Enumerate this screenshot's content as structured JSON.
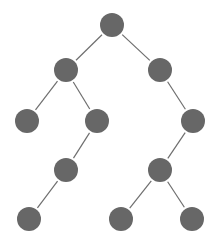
{
  "diagram": {
    "type": "binary-tree",
    "width": 219,
    "height": 244,
    "colors": {
      "node_fill": "#676767",
      "edge_stroke": "#6e6e6e",
      "background": "#ffffff"
    },
    "node_radius": 12,
    "nodes": [
      {
        "id": "n0",
        "x": 112,
        "y": 25,
        "level": 0
      },
      {
        "id": "n1",
        "x": 66,
        "y": 70,
        "level": 1
      },
      {
        "id": "n2",
        "x": 160,
        "y": 70,
        "level": 1
      },
      {
        "id": "n3",
        "x": 27,
        "y": 121,
        "level": 2
      },
      {
        "id": "n4",
        "x": 97,
        "y": 121,
        "level": 2
      },
      {
        "id": "n5",
        "x": 193,
        "y": 121,
        "level": 2
      },
      {
        "id": "n6",
        "x": 66,
        "y": 170,
        "level": 3
      },
      {
        "id": "n7",
        "x": 160,
        "y": 170,
        "level": 3
      },
      {
        "id": "n8",
        "x": 29,
        "y": 219,
        "level": 4
      },
      {
        "id": "n9",
        "x": 121,
        "y": 219,
        "level": 4
      },
      {
        "id": "n10",
        "x": 192,
        "y": 219,
        "level": 4
      }
    ],
    "edges": [
      {
        "from": "n0",
        "to": "n1"
      },
      {
        "from": "n0",
        "to": "n2"
      },
      {
        "from": "n1",
        "to": "n3"
      },
      {
        "from": "n1",
        "to": "n4"
      },
      {
        "from": "n2",
        "to": "n5"
      },
      {
        "from": "n4",
        "to": "n6"
      },
      {
        "from": "n5",
        "to": "n7"
      },
      {
        "from": "n6",
        "to": "n8"
      },
      {
        "from": "n7",
        "to": "n9"
      },
      {
        "from": "n7",
        "to": "n10"
      }
    ]
  }
}
